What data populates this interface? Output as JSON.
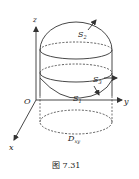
{
  "figure": {
    "caption": "图 7.31",
    "axes": {
      "x": "x",
      "y": "y",
      "z": "z",
      "origin": "O"
    },
    "surfaces": {
      "S1": {
        "label": "S",
        "sub": "1"
      },
      "S2": {
        "label": "S",
        "sub": "2"
      },
      "S3": {
        "label": "S",
        "sub": "3"
      }
    },
    "region": {
      "label": "D",
      "sub": "xy"
    },
    "colors": {
      "stroke": "#333333",
      "background": "#ffffff"
    }
  }
}
